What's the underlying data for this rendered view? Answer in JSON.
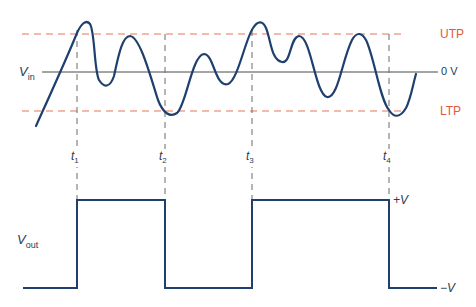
{
  "diagram": {
    "type": "schmitt-trigger-waveforms",
    "colors": {
      "signal": "#1f3f6e",
      "threshold": "#e8765a",
      "threshold_label": "#e05a3a",
      "axis": "#4a4a4a",
      "guide": "#6a6a6a",
      "text": "#2a3a55"
    },
    "input": {
      "label_main": "V",
      "label_sub": "in",
      "zero_label": "0 V",
      "upper_threshold_label": "UTP",
      "lower_threshold_label": "LTP"
    },
    "output": {
      "label_main": "V",
      "label_sub": "out",
      "high_label": "+V",
      "low_label": "−V"
    },
    "time_markers": [
      {
        "main": "t",
        "sub": "1"
      },
      {
        "main": "t",
        "sub": "2"
      },
      {
        "main": "t",
        "sub": "3"
      },
      {
        "main": "t",
        "sub": "4"
      }
    ]
  }
}
